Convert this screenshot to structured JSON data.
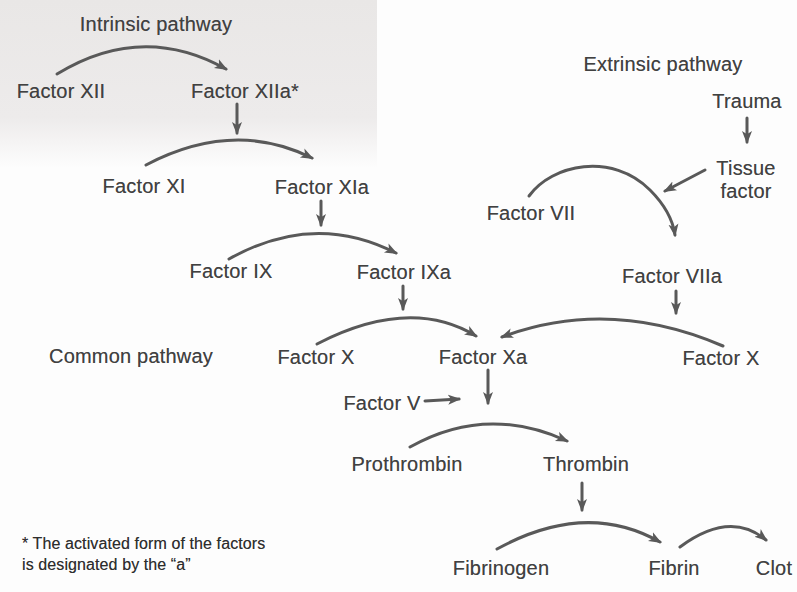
{
  "sections": {
    "intrinsic": "Intrinsic pathway",
    "extrinsic": "Extrinsic pathway",
    "common": "Common pathway"
  },
  "nodes": {
    "factor_xii": "Factor XII",
    "factor_xiia": "Factor XIIa*",
    "factor_xi": "Factor XI",
    "factor_xia": "Factor XIa",
    "factor_ix": "Factor IX",
    "factor_ixa": "Factor IXa",
    "trauma": "Trauma",
    "tissue_factor": "Tissue factor",
    "factor_vii": "Factor VII",
    "factor_viia": "Factor VIIa",
    "factor_x_left": "Factor X",
    "factor_xa": "Factor Xa",
    "factor_x_right": "Factor X",
    "factor_v": "Factor V",
    "prothrombin": "Prothrombin",
    "thrombin": "Thrombin",
    "fibrinogen": "Fibrinogen",
    "fibrin": "Fibrin",
    "clot": "Clot"
  },
  "footnote": {
    "line1": "* The activated form of the factors",
    "line2": "is designated by the “a”"
  },
  "colors": {
    "text": "#414141",
    "arrow": "#595959",
    "background": "#fdfdfd",
    "scan_tint": "#e9e7e6"
  }
}
